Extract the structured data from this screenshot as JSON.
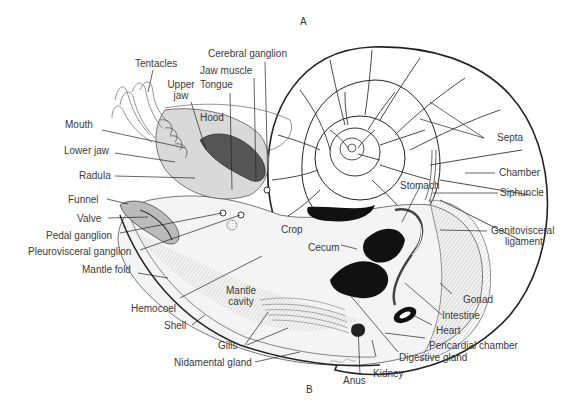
{
  "figure": {
    "panel_labels": {
      "a": "A",
      "b": "B"
    },
    "signature": "spk",
    "labels": {
      "tentacles": "Tentacles",
      "cerebral_ganglion": "Cerebral ganglion",
      "jaw_muscle": "Jaw muscle",
      "upper_jaw_1": "Upper",
      "upper_jaw_2": "jaw",
      "tongue": "Tongue",
      "hood": "Hood",
      "mouth": "Mouth",
      "lower_jaw": "Lower jaw",
      "radula": "Radula",
      "funnel": "Funnel",
      "valve": "Valve",
      "pedal_ganglion": "Pedal ganglion",
      "pleurovisceral_ganglion": "Pleurovisceral ganglion",
      "mantle_fold": "Mantle fold",
      "hemocoel": "Hemocoel",
      "shell": "Shell",
      "mantle_cavity_1": "Mantle",
      "mantle_cavity_2": "cavity",
      "gills": "Gills",
      "nidamental_gland": "Nidamental gland",
      "crop": "Crop",
      "cecum": "Cecum",
      "stomach": "Stomach",
      "septa": "Septa",
      "chamber": "Chamber",
      "siphuncle": "Siphuncle",
      "genitovisceral_1": "Genitovisceral",
      "genitovisceral_2": "ligament",
      "gonad": "Gonad",
      "intestine": "Intestine",
      "heart": "Heart",
      "pericardial_chamber": "Pericardial chamber",
      "digestive_gland": "Digestive gland",
      "kidney": "Kidney",
      "anus": "Anus"
    }
  }
}
